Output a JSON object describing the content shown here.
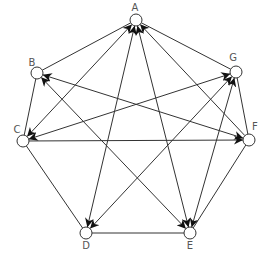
{
  "diagram": {
    "type": "directed-graph",
    "nodes": [
      {
        "id": "A",
        "label": "A"
      },
      {
        "id": "B",
        "label": "B"
      },
      {
        "id": "C",
        "label": "C"
      },
      {
        "id": "D",
        "label": "D"
      },
      {
        "id": "E",
        "label": "E"
      },
      {
        "id": "F",
        "label": "F"
      },
      {
        "id": "G",
        "label": "G"
      }
    ],
    "undirected_edges": [
      [
        "A",
        "B"
      ],
      [
        "B",
        "C"
      ],
      [
        "C",
        "D"
      ],
      [
        "D",
        "E"
      ],
      [
        "E",
        "F"
      ],
      [
        "F",
        "G"
      ],
      [
        "G",
        "A"
      ]
    ],
    "bidirectional_edges": [
      [
        "A",
        "C"
      ],
      [
        "A",
        "D"
      ],
      [
        "A",
        "E"
      ],
      [
        "B",
        "F"
      ],
      [
        "B",
        "E"
      ],
      [
        "C",
        "G"
      ],
      [
        "D",
        "G"
      ],
      [
        "E",
        "G"
      ]
    ],
    "directed_edges": [
      {
        "from": "F",
        "to": "A"
      },
      {
        "from": "C",
        "to": "F"
      }
    ],
    "colors": {
      "stroke": "#333333",
      "node_fill": "#ffffff",
      "label": "#555555"
    }
  }
}
